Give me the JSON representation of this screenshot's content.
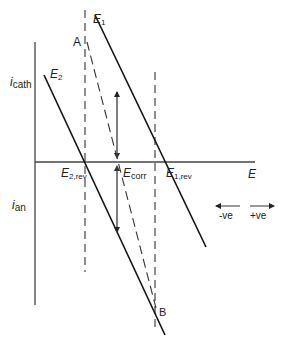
{
  "diagram": {
    "axes": {
      "y_top_label_main": "i",
      "y_top_label_sub": "cath",
      "y_bottom_label_main": "i",
      "y_bottom_label_sub": "an",
      "x_label": "E"
    },
    "lines": {
      "line1_label_main": "E",
      "line1_label_sub": "1",
      "line2_label_main": "E",
      "line2_label_sub": "2"
    },
    "points": {
      "A": "A",
      "B": "B"
    },
    "intercepts": {
      "e2rev_main": "E",
      "e2rev_sub": "2,rev",
      "ecorr_main": "E",
      "ecorr_sub": "corr",
      "e1rev_main": "E",
      "e1rev_sub": "1,rev"
    },
    "direction_legend": {
      "negative": "-ve",
      "positive": "+ve"
    },
    "colors": {
      "ink": "#222222",
      "background": "#ffffff"
    }
  }
}
